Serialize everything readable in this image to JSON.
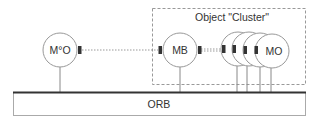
{
  "diagram": {
    "cluster": {
      "label": "Object \"Cluster\""
    },
    "nodes": {
      "mo_star": {
        "label": "M°O"
      },
      "mb": {
        "label": "MB"
      },
      "mo": {
        "label": "MO"
      }
    },
    "bus": {
      "label": "ORB"
    },
    "colors": {
      "stroke": "#888888",
      "connector": "#333333",
      "bus_top": "#333333",
      "text": "#333333"
    }
  }
}
